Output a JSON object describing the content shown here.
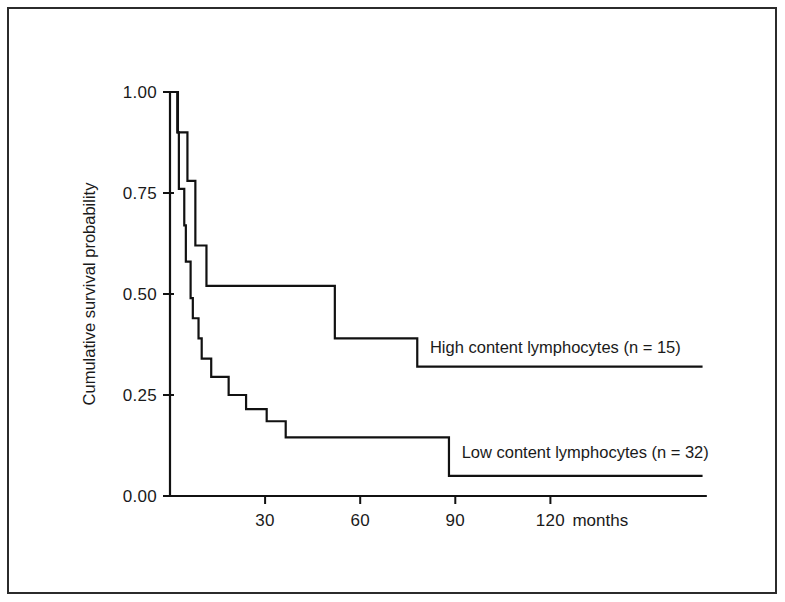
{
  "chart_data": {
    "type": "line",
    "subtype": "kaplan-meier-step",
    "title": "",
    "xlabel": "months",
    "ylabel": "Cumulative survival probability",
    "xlim": [
      0,
      169
    ],
    "ylim": [
      0.0,
      1.0
    ],
    "grid": false,
    "legend_position": "inline-right-of-curve",
    "x_ticks": [
      30,
      60,
      90,
      120
    ],
    "x_tick_labels": [
      "30",
      "60",
      "90",
      "120"
    ],
    "x_unit_suffix": "months",
    "y_ticks": [
      0.0,
      0.25,
      0.5,
      0.75,
      1.0
    ],
    "y_tick_labels": [
      "0.00",
      "0.25",
      "0.50",
      "0.75",
      "1.00"
    ],
    "series": [
      {
        "name": "High content lymphocytes (n = 15)",
        "label": "High content lymphocytes (n = 15)",
        "n": 15,
        "group": "high",
        "steps": [
          {
            "t": 0,
            "s": 1.0
          },
          {
            "t": 2.5,
            "s": 0.9
          },
          {
            "t": 5.5,
            "s": 0.78
          },
          {
            "t": 8.0,
            "s": 0.62
          },
          {
            "t": 11.5,
            "s": 0.52
          },
          {
            "t": 52.0,
            "s": 0.39
          },
          {
            "t": 78.0,
            "s": 0.32
          },
          {
            "t": 168.0,
            "s": 0.32
          }
        ]
      },
      {
        "name": "Low content lymphocytes (n = 32)",
        "label": "Low content lymphocytes (n = 32)",
        "n": 32,
        "group": "low",
        "steps": [
          {
            "t": 0,
            "s": 1.0
          },
          {
            "t": 2.3,
            "s": 0.9
          },
          {
            "t": 2.8,
            "s": 0.76
          },
          {
            "t": 4.5,
            "s": 0.67
          },
          {
            "t": 5.0,
            "s": 0.58
          },
          {
            "t": 6.5,
            "s": 0.49
          },
          {
            "t": 7.2,
            "s": 0.44
          },
          {
            "t": 9.0,
            "s": 0.39
          },
          {
            "t": 10.0,
            "s": 0.34
          },
          {
            "t": 13.0,
            "s": 0.295
          },
          {
            "t": 18.5,
            "s": 0.25
          },
          {
            "t": 24.0,
            "s": 0.215
          },
          {
            "t": 30.5,
            "s": 0.185
          },
          {
            "t": 36.5,
            "s": 0.145
          },
          {
            "t": 88.0,
            "s": 0.05
          },
          {
            "t": 168.0,
            "s": 0.05
          }
        ]
      }
    ],
    "annotations": [
      {
        "id": "high-label",
        "text": "High content lymphocytes (n = 15)",
        "t": 82,
        "s": 0.355
      },
      {
        "id": "low-label",
        "text": "Low content lymphocytes (n = 32)",
        "t": 92,
        "s": 0.095
      }
    ]
  },
  "axes": {
    "y_title": "Cumulative survival probability",
    "x_unit": "months"
  }
}
